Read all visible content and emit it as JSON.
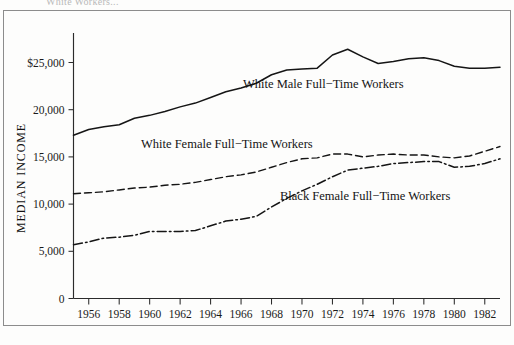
{
  "figure": {
    "caption_fragment": "White Workers...",
    "background_color": "#fdfdfc",
    "ink_color": "#151515"
  },
  "axis": {
    "y_title": "MEDIAN INCOME",
    "y_tick_labels": [
      "$25,000",
      "20,000",
      "15,000",
      "10,000",
      "5,000",
      "0"
    ],
    "x_tick_labels": [
      "1956",
      "1958",
      "1960",
      "1962",
      "1964",
      "1966",
      "1968",
      "1970",
      "1972",
      "1974",
      "1976",
      "1978",
      "1980",
      "1982"
    ]
  },
  "series_labels": {
    "white_male": "White Male Full−Time Workers",
    "white_female": "White Female Full−Time Workers",
    "black_female": "Black Female Full−Time Workers"
  },
  "chart_data": {
    "type": "line",
    "title": "",
    "xlabel": "",
    "ylabel": "MEDIAN INCOME",
    "xlim": [
      1955,
      1983
    ],
    "ylim": [
      0,
      27500
    ],
    "grid": false,
    "legend": "inline-annotations",
    "y_ticks": [
      0,
      5000,
      10000,
      15000,
      20000,
      25000
    ],
    "y_tick_labels": [
      "0",
      "5,000",
      "10,000",
      "15,000",
      "20,000",
      "$25,000"
    ],
    "x_ticks": [
      1956,
      1958,
      1960,
      1962,
      1964,
      1966,
      1968,
      1970,
      1972,
      1974,
      1976,
      1978,
      1980,
      1982
    ],
    "x": [
      1955,
      1956,
      1957,
      1958,
      1959,
      1960,
      1961,
      1962,
      1963,
      1964,
      1965,
      1966,
      1967,
      1968,
      1969,
      1970,
      1971,
      1972,
      1973,
      1974,
      1975,
      1976,
      1977,
      1978,
      1979,
      1980,
      1981,
      1982,
      1983
    ],
    "series": [
      {
        "name": "White Male Full−Time Workers",
        "line_style": "solid",
        "color": "#151515",
        "values": [
          17300,
          17900,
          18200,
          18400,
          19100,
          19400,
          19800,
          20300,
          20700,
          21300,
          21900,
          22300,
          22800,
          23700,
          24200,
          24300,
          24400,
          25800,
          26400,
          25600,
          24900,
          25100,
          25400,
          25500,
          25200,
          24600,
          24400,
          24400,
          24500
        ]
      },
      {
        "name": "White Female Full−Time Workers",
        "line_style": "dashed",
        "color": "#151515",
        "values": [
          11100,
          11200,
          11300,
          11500,
          11700,
          11800,
          12000,
          12100,
          12300,
          12600,
          12900,
          13100,
          13400,
          13900,
          14400,
          14800,
          14900,
          15300,
          15300,
          15000,
          15200,
          15300,
          15200,
          15200,
          15000,
          14900,
          15100,
          15600,
          16100
        ]
      },
      {
        "name": "Black Female Full−Time Workers",
        "line_style": "dash-dot",
        "color": "#151515",
        "values": [
          5700,
          6000,
          6400,
          6500,
          6700,
          7100,
          7100,
          7100,
          7200,
          7700,
          8200,
          8400,
          8700,
          9700,
          10600,
          11400,
          12100,
          12900,
          13600,
          13800,
          14000,
          14300,
          14400,
          14500,
          14500,
          13900,
          14000,
          14300,
          14800
        ]
      }
    ]
  }
}
